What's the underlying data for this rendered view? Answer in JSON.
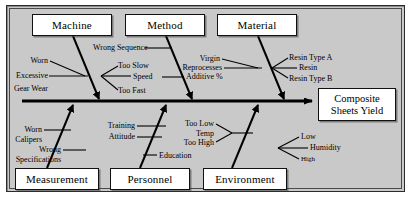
{
  "diagram": {
    "type": "fishbone-ishikawa",
    "effect": {
      "line1": "Composite",
      "line2": "Sheets Yield"
    },
    "categories": [
      {
        "id": "machine",
        "label": "Machine",
        "position": "top"
      },
      {
        "id": "method",
        "label": "Method",
        "position": "top"
      },
      {
        "id": "material",
        "label": "Material",
        "position": "top"
      },
      {
        "id": "measurement",
        "label": "Measurement",
        "position": "bottom"
      },
      {
        "id": "personnel",
        "label": "Personnel",
        "position": "bottom"
      },
      {
        "id": "environment",
        "label": "Environment",
        "position": "bottom"
      }
    ],
    "causes": {
      "machine": [
        "Worn",
        "Excessive",
        "Gear Wear",
        "Too Slow",
        "Speed",
        "Too Fast"
      ],
      "method": [
        "Wrong Sequence",
        "Additive %"
      ],
      "material": [
        "Virgin",
        "Reprocesses",
        "Resin Type A",
        "Resin",
        "Resin Type B"
      ],
      "measurement": [
        "Worn",
        "Calipers",
        "Wrong",
        "Specifications"
      ],
      "personnel": [
        "Training",
        "Attitude",
        "Education"
      ],
      "environment": [
        "Too Low",
        "Temp",
        "Too High",
        "Low",
        "Humidity",
        "High"
      ]
    },
    "labels": {
      "machine_worn": "Worn",
      "machine_excessive": "Excessive",
      "machine_gear_wear": "Gear Wear",
      "machine_too_slow": "Too Slow",
      "machine_speed": "Speed",
      "machine_too_fast": "Too Fast",
      "method_wrong_sequence": "Wrong Sequence",
      "method_additive": "Additive %",
      "material_virgin": "Virgin",
      "material_reprocesses": "Reprocesses",
      "material_resin_type_a": "Resin Type A",
      "material_resin": "Resin",
      "material_resin_type_b": "Resin Type B",
      "measurement_worn": "Worn",
      "measurement_calipers": "Calipers",
      "measurement_wrong": "Wrong",
      "measurement_specifications": "Specifications",
      "personnel_training": "Training",
      "personnel_attitude": "Attitude",
      "personnel_education": "Education",
      "environment_too_low": "Too Low",
      "environment_temp": "Temp",
      "environment_too_high": "Too High",
      "environment_low": "Low",
      "environment_humidity": "Humidity",
      "environment_high": "High"
    },
    "colors": {
      "background": "#c9c9c9",
      "page": "#ffffff",
      "line": "#000000",
      "box_fill": "#ffffff",
      "border": "#2b2b2b"
    }
  }
}
